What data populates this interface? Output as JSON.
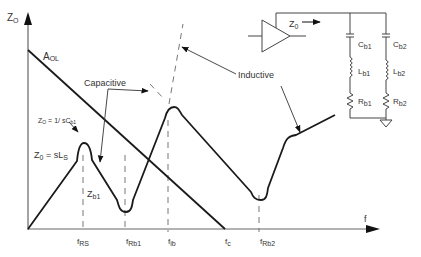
{
  "figure": {
    "y_axis_label": "Z",
    "y_axis_sub": "O",
    "x_axis_label": "f",
    "aol_label": "A",
    "aol_sub": "OL",
    "annotations": {
      "capacitive": "Capacitive",
      "inductive": "Inductive",
      "zo_cb1_main": "Z",
      "zo_cb1_sub": "O",
      "zo_cb1_rest": " = 1/ sC",
      "zo_cb1_sub2": "b1",
      "zo_sls_main": "Z",
      "zo_sls_sub": "0",
      "zo_sls_rest": " = sL",
      "zo_sls_sub2": "S",
      "zb1_main": "Z",
      "zb1_sub": "b1"
    },
    "x_ticks": [
      {
        "main": "f",
        "sub": "RS"
      },
      {
        "main": "f",
        "sub": "Rb1"
      },
      {
        "main": "f",
        "sub": "ib"
      },
      {
        "main": "f",
        "sub": "c"
      },
      {
        "main": "f",
        "sub": "Rb2"
      }
    ],
    "circuit": {
      "output_label_main": "Z",
      "output_label_sub": "0",
      "components": [
        {
          "main": "C",
          "sub": "b1"
        },
        {
          "main": "C",
          "sub": "b2"
        },
        {
          "main": "L",
          "sub": "b1"
        },
        {
          "main": "L",
          "sub": "b2"
        },
        {
          "main": "R",
          "sub": "b1"
        },
        {
          "main": "R",
          "sub": "b2"
        }
      ]
    },
    "colors": {
      "line": "#1a1a1a",
      "axis": "#555555",
      "dash": "#666666",
      "text": "#333333"
    }
  }
}
